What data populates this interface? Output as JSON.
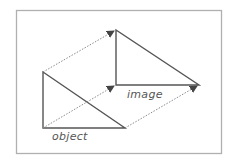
{
  "diagram": {
    "type": "translation",
    "colors": {
      "frame": "#b0b0b0",
      "shape": "#555555",
      "arrow": "#8a8a8a",
      "label": "#555555",
      "background": "#ffffff"
    },
    "labels": {
      "object": "object",
      "image": "image"
    },
    "object_triangle": {
      "vertices": [
        [
          43,
          72
        ],
        [
          43,
          128
        ],
        [
          125,
          128
        ]
      ]
    },
    "image_triangle": {
      "vertices": [
        [
          116,
          30
        ],
        [
          116,
          85
        ],
        [
          199,
          85
        ]
      ]
    },
    "arrows": [
      {
        "from": [
          43,
          72
        ],
        "to": [
          114,
          31
        ]
      },
      {
        "from": [
          43,
          128
        ],
        "to": [
          114,
          86
        ]
      },
      {
        "from": [
          125,
          128
        ],
        "to": [
          197,
          86
        ]
      }
    ]
  }
}
